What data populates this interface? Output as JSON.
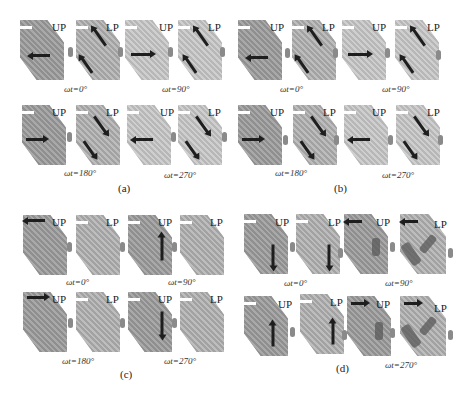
{
  "figure": {
    "panel_labels": [
      "(a)",
      "(b)",
      "(c)",
      "(d)"
    ],
    "plate_labels": {
      "upper": "UP",
      "lower": "LP"
    },
    "phase_labels": [
      "ωt=0°",
      "ωt=90°",
      "ωt=180°",
      "ωt=270°"
    ],
    "panels": [
      {
        "id": "a",
        "label": "(a)",
        "phases": [
          "ωt=0°",
          "ωt=90°",
          "ωt=180°",
          "ωt=270°"
        ]
      },
      {
        "id": "b",
        "label": "(b)",
        "phases": [
          "ωt=0°",
          "ωt=90°",
          "ωt=180°",
          "ωt=270°"
        ]
      },
      {
        "id": "c",
        "label": "(c)",
        "phases": [
          "ωt=0°",
          "ωt=90°",
          "ωt=180°",
          "ωt=270°"
        ]
      },
      {
        "id": "d",
        "label": "(d)",
        "phases": [
          "ωt=0°",
          "ωt=90°",
          "ωt=270°"
        ]
      }
    ]
  }
}
